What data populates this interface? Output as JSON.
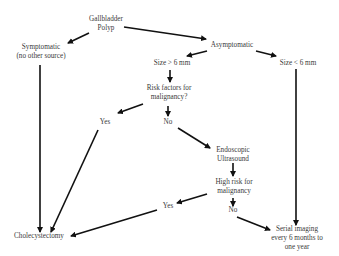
{
  "diagram": {
    "type": "flowchart",
    "colors": {
      "line": "#111111",
      "text": "#3a3a3a",
      "background": "#ffffff"
    },
    "nodes": {
      "root": {
        "line1": "Gallbladder",
        "line2": "Polyp"
      },
      "symptomatic": {
        "line1": "Symptomatic",
        "line2": "(no other source)"
      },
      "asymptomatic": {
        "line1": "Asymptomatic"
      },
      "size_gt": {
        "line1": "Size > 6 mm"
      },
      "size_lt": {
        "line1": "Size < 6 mm"
      },
      "risk_factors": {
        "line1": "Risk factors for",
        "line2": "malignancy?"
      },
      "yes1": {
        "line1": "Yes"
      },
      "no1": {
        "line1": "No"
      },
      "eus": {
        "line1": "Endoscopic",
        "line2": "Ultrasound"
      },
      "high_risk": {
        "line1": "High risk for",
        "line2": "malignancy"
      },
      "yes2": {
        "line1": "Yes"
      },
      "no2": {
        "line1": "No"
      },
      "cholecystectomy": {
        "line1": "Cholecystectomy"
      },
      "serial": {
        "line1": "Serial imaging",
        "line2": "every 6 months to",
        "line3": "one year"
      }
    },
    "edges": [
      [
        "root",
        "symptomatic"
      ],
      [
        "root",
        "asymptomatic"
      ],
      [
        "asymptomatic",
        "size_gt"
      ],
      [
        "asymptomatic",
        "size_lt"
      ],
      [
        "size_gt",
        "risk_factors"
      ],
      [
        "risk_factors",
        "yes1"
      ],
      [
        "risk_factors",
        "no1"
      ],
      [
        "no1",
        "eus"
      ],
      [
        "eus",
        "high_risk"
      ],
      [
        "high_risk",
        "yes2"
      ],
      [
        "high_risk",
        "no2"
      ],
      [
        "symptomatic",
        "cholecystectomy"
      ],
      [
        "yes1",
        "cholecystectomy"
      ],
      [
        "yes2",
        "cholecystectomy"
      ],
      [
        "no2",
        "serial"
      ],
      [
        "size_lt",
        "serial"
      ]
    ]
  }
}
